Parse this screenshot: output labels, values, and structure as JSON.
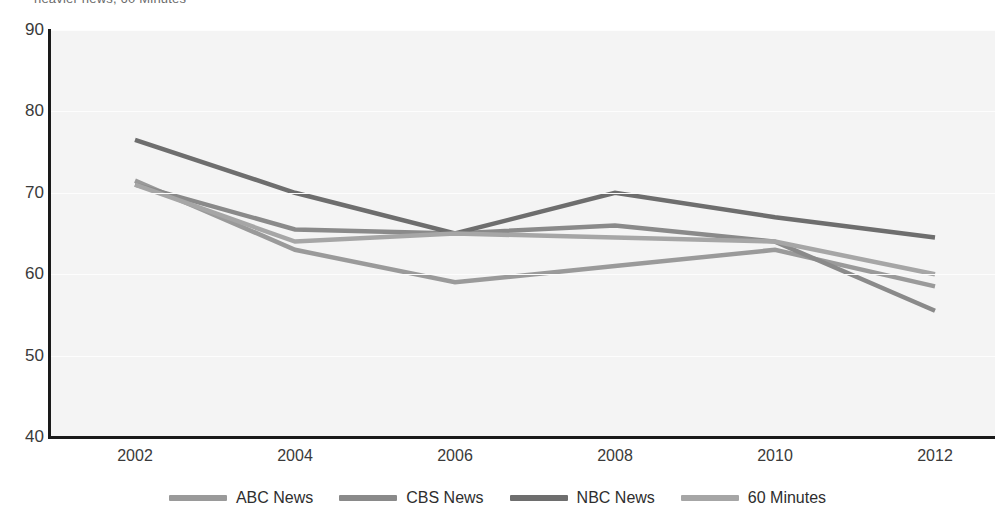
{
  "title": {
    "text": "heavier news, 60 Minutes"
  },
  "legend": {
    "position": "bottom-center",
    "items": [
      {
        "label": "ABC News",
        "color": "#9a9a9a",
        "swatch_name": "legend-swatch-abc"
      },
      {
        "label": "CBS News",
        "color": "#8a8a8a",
        "swatch_name": "legend-swatch-cbs"
      },
      {
        "label": "NBC News",
        "color": "#6e6e6e",
        "swatch_name": "legend-swatch-nbc"
      },
      {
        "label": "60 Minutes",
        "color": "#a6a6a6",
        "swatch_name": "legend-swatch-60minutes"
      }
    ]
  },
  "axes": {
    "y_ticks": [
      "90",
      "80",
      "70",
      "60",
      "50",
      "40"
    ],
    "x_ticks": [
      "2002",
      "2004",
      "2006",
      "2008",
      "2010",
      "2012"
    ]
  },
  "colors": {
    "plot_background": "#f4f4f4",
    "axis": "#1a1a1a",
    "gridline": "#fdfdfd",
    "tick_text": "#3a3a3a"
  },
  "chart_data": {
    "type": "line",
    "title": "heavier news, 60 Minutes",
    "xlabel": "",
    "ylabel": "",
    "x": [
      2002,
      2004,
      2006,
      2008,
      2010,
      2012
    ],
    "categories": [
      "2002",
      "2004",
      "2006",
      "2008",
      "2010",
      "2012"
    ],
    "ylim": [
      40,
      90
    ],
    "yticks": [
      40,
      50,
      60,
      70,
      80,
      90
    ],
    "grid": true,
    "legend_position": "bottom-center",
    "series": [
      {
        "name": "ABC News",
        "color": "#9a9a9a",
        "values": [
          71.5,
          63,
          59,
          61,
          63,
          58.5
        ]
      },
      {
        "name": "CBS News",
        "color": "#8a8a8a",
        "values": [
          71,
          65.5,
          65,
          66,
          64,
          55.5
        ]
      },
      {
        "name": "NBC News",
        "color": "#6e6e6e",
        "values": [
          76.5,
          70,
          65,
          70,
          67,
          64.5
        ]
      },
      {
        "name": "60 Minutes",
        "color": "#a6a6a6",
        "values": [
          71,
          64,
          65,
          64.5,
          64,
          60
        ]
      }
    ]
  }
}
